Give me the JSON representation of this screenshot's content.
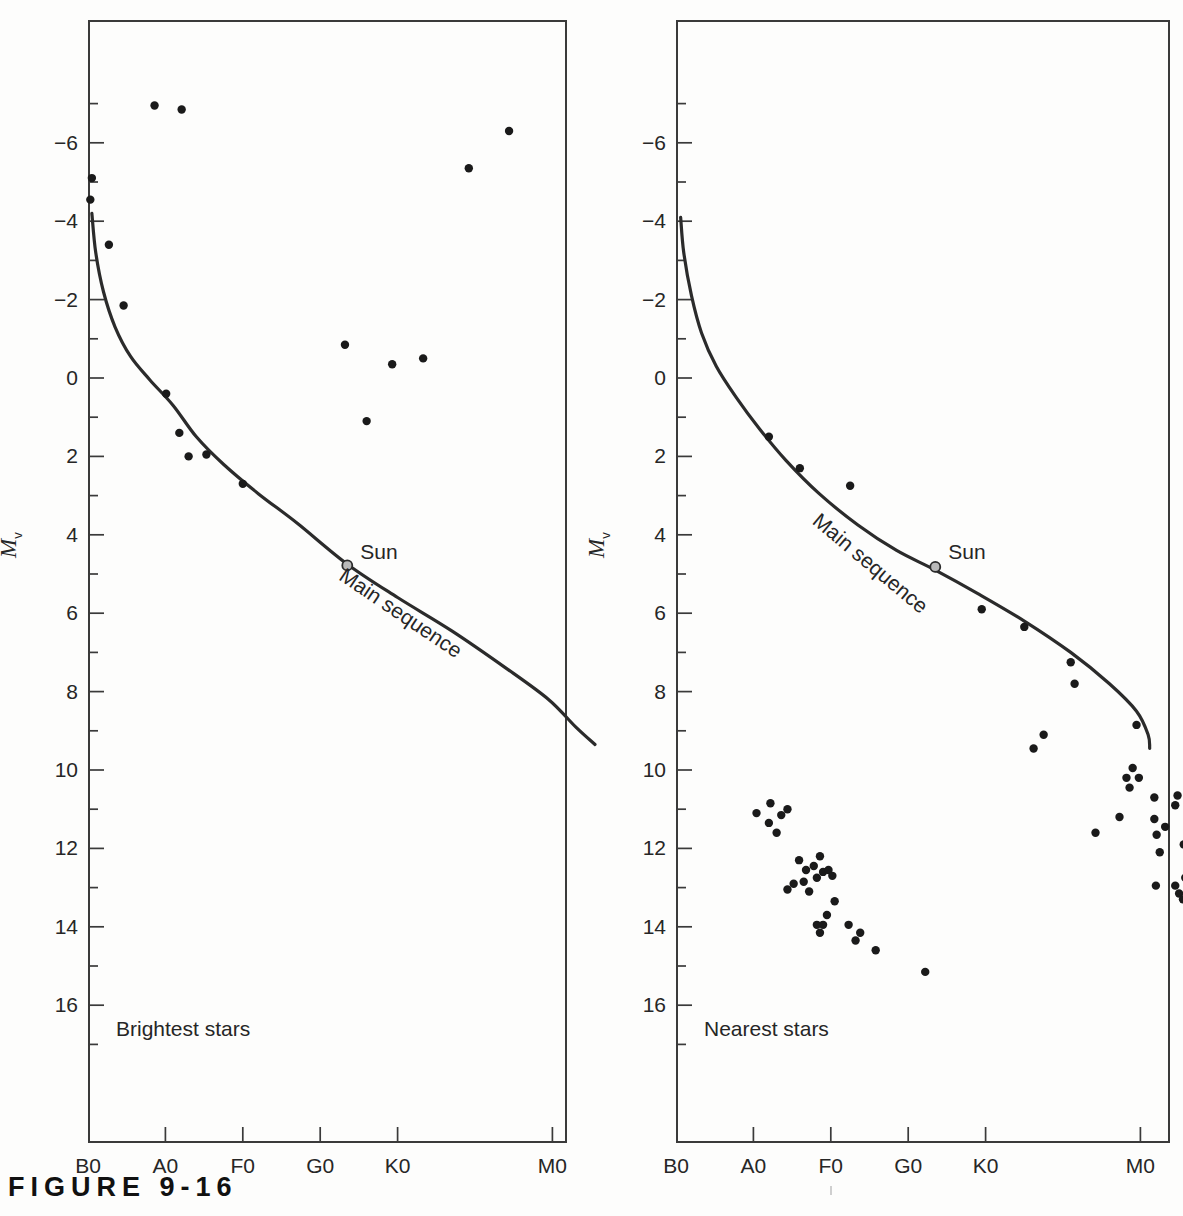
{
  "figure": {
    "caption": "F I G U R E   9 - 1 6",
    "caption_plain": "FIGURE 9-16"
  },
  "axis": {
    "y_title_symbol": "M",
    "y_title_subscript": "v",
    "y_ticks_major": [
      "-6",
      "-4",
      "-2",
      "0",
      "2",
      "4",
      "6",
      "8",
      "10",
      "12",
      "14",
      "16"
    ],
    "x_ticks": [
      "B0",
      "A0",
      "F0",
      "G0",
      "K0",
      "M0"
    ]
  },
  "panels": [
    {
      "id": "brightest",
      "caption": "Brightest stars",
      "sun_label": "Sun",
      "main_sequence_label": "Main sequence"
    },
    {
      "id": "nearest",
      "caption": "Nearest stars",
      "sun_label": "Sun",
      "main_sequence_label": "Main sequence"
    }
  ],
  "colors": {
    "ink": "#262626",
    "frame": "#3a3a3a",
    "point": "#1a1a1a",
    "curve": "#2b2b2b",
    "background": "#fdfdfc",
    "sun_marker_fill": "#b9b9b9"
  },
  "chart_data": [
    {
      "type": "scatter",
      "title": "Brightest stars",
      "xlabel": "Spectral type",
      "ylabel": "Mv",
      "xlim": [
        "B0",
        "M5"
      ],
      "ylim": [
        -7.6,
        17.4
      ],
      "y_inverted": true,
      "grid": false,
      "legend": "none",
      "x_categories": [
        "B0",
        "A0",
        "F0",
        "G0",
        "K0",
        "M0"
      ],
      "annotations": [
        {
          "text": "Sun",
          "x": 3.35,
          "y": 4.8
        },
        {
          "text": "Main sequence",
          "x": 3.9,
          "y": 6.4,
          "rotation": 34
        }
      ],
      "series": [
        {
          "name": "Brightest stars",
          "points": [
            {
              "x": 0.86,
              "y": -6.95
            },
            {
              "x": 1.21,
              "y": -6.85
            },
            {
              "x": 4.92,
              "y": -5.35
            },
            {
              "x": 5.44,
              "y": -6.3
            },
            {
              "x": 0.05,
              "y": -5.1
            },
            {
              "x": 0.03,
              "y": -4.55
            },
            {
              "x": 0.27,
              "y": -3.4
            },
            {
              "x": 0.46,
              "y": -1.85
            },
            {
              "x": 3.32,
              "y": -0.85
            },
            {
              "x": 3.93,
              "y": -0.35
            },
            {
              "x": 4.33,
              "y": -0.5
            },
            {
              "x": 3.6,
              "y": 1.1
            },
            {
              "x": 1.01,
              "y": 0.4
            },
            {
              "x": 1.18,
              "y": 1.4
            },
            {
              "x": 1.3,
              "y": 2.0
            },
            {
              "x": 1.53,
              "y": 1.95
            },
            {
              "x": 2.0,
              "y": 2.7
            }
          ]
        }
      ],
      "main_sequence_curve": [
        {
          "x": 0.05,
          "y": -4.2
        },
        {
          "x": 0.1,
          "y": -3.2
        },
        {
          "x": 0.2,
          "y": -2.2
        },
        {
          "x": 0.35,
          "y": -1.3
        },
        {
          "x": 0.55,
          "y": -0.55
        },
        {
          "x": 0.8,
          "y": 0.05
        },
        {
          "x": 1.1,
          "y": 0.7
        },
        {
          "x": 1.4,
          "y": 1.5
        },
        {
          "x": 1.75,
          "y": 2.2
        },
        {
          "x": 2.2,
          "y": 2.95
        },
        {
          "x": 2.7,
          "y": 3.7
        },
        {
          "x": 3.35,
          "y": 4.75
        },
        {
          "x": 4.0,
          "y": 5.6
        },
        {
          "x": 4.7,
          "y": 6.45
        },
        {
          "x": 5.4,
          "y": 7.4
        },
        {
          "x": 5.95,
          "y": 8.2
        },
        {
          "x": 6.3,
          "y": 8.9
        },
        {
          "x": 6.55,
          "y": 9.35
        }
      ],
      "sun_point": {
        "x": 3.35,
        "y": 4.78
      }
    },
    {
      "type": "scatter",
      "title": "Nearest stars",
      "xlabel": "Spectral type",
      "ylabel": "Mv",
      "xlim": [
        "B0",
        "M5"
      ],
      "ylim": [
        -7.6,
        17.4
      ],
      "y_inverted": true,
      "grid": false,
      "legend": "none",
      "x_categories": [
        "B0",
        "A0",
        "F0",
        "G0",
        "K0",
        "M0"
      ],
      "annotations": [
        {
          "text": "Sun",
          "x": 3.35,
          "y": 4.8
        },
        {
          "text": "Main sequence",
          "x": 2.35,
          "y": 5.1,
          "rotation": 40
        }
      ],
      "series": [
        {
          "name": "Main-sequence nearby stars",
          "points": [
            {
              "x": 1.2,
              "y": 1.5
            },
            {
              "x": 1.6,
              "y": 2.3
            },
            {
              "x": 2.25,
              "y": 2.75
            },
            {
              "x": 3.35,
              "y": 4.85
            },
            {
              "x": 3.95,
              "y": 5.9
            },
            {
              "x": 4.5,
              "y": 6.35
            },
            {
              "x": 5.1,
              "y": 7.25
            },
            {
              "x": 5.15,
              "y": 7.8
            },
            {
              "x": 4.75,
              "y": 9.1
            },
            {
              "x": 5.95,
              "y": 8.85
            }
          ]
        },
        {
          "name": "White dwarfs",
          "points": [
            {
              "x": 1.04,
              "y": 11.1
            },
            {
              "x": 1.22,
              "y": 10.85
            },
            {
              "x": 1.44,
              "y": 11.0
            },
            {
              "x": 1.36,
              "y": 11.15
            },
            {
              "x": 1.2,
              "y": 11.35
            },
            {
              "x": 1.3,
              "y": 11.6
            },
            {
              "x": 1.59,
              "y": 12.3
            },
            {
              "x": 1.86,
              "y": 12.2
            },
            {
              "x": 1.68,
              "y": 12.55
            },
            {
              "x": 1.78,
              "y": 12.45
            },
            {
              "x": 1.9,
              "y": 12.6
            },
            {
              "x": 1.97,
              "y": 12.55
            },
            {
              "x": 2.02,
              "y": 12.7
            },
            {
              "x": 1.82,
              "y": 12.75
            },
            {
              "x": 1.65,
              "y": 12.85
            },
            {
              "x": 1.52,
              "y": 12.9
            },
            {
              "x": 1.44,
              "y": 13.05
            },
            {
              "x": 1.72,
              "y": 13.1
            },
            {
              "x": 2.05,
              "y": 13.35
            },
            {
              "x": 1.95,
              "y": 13.7
            },
            {
              "x": 1.82,
              "y": 13.95
            },
            {
              "x": 1.9,
              "y": 13.95
            },
            {
              "x": 1.86,
              "y": 14.15
            },
            {
              "x": 2.23,
              "y": 13.95
            },
            {
              "x": 2.38,
              "y": 14.15
            },
            {
              "x": 2.32,
              "y": 14.35
            },
            {
              "x": 2.58,
              "y": 14.6
            },
            {
              "x": 3.22,
              "y": 15.15
            }
          ]
        },
        {
          "name": "Red dwarfs",
          "points": [
            {
              "x": 4.62,
              "y": 9.45
            },
            {
              "x": 5.9,
              "y": 9.95
            },
            {
              "x": 5.82,
              "y": 10.2
            },
            {
              "x": 5.98,
              "y": 10.2
            },
            {
              "x": 5.86,
              "y": 10.45
            },
            {
              "x": 6.18,
              "y": 10.7
            },
            {
              "x": 6.48,
              "y": 10.65
            },
            {
              "x": 6.45,
              "y": 10.9
            },
            {
              "x": 5.73,
              "y": 11.2
            },
            {
              "x": 6.18,
              "y": 11.25
            },
            {
              "x": 6.32,
              "y": 11.45
            },
            {
              "x": 5.42,
              "y": 11.6
            },
            {
              "x": 6.21,
              "y": 11.65
            },
            {
              "x": 6.65,
              "y": 11.65
            },
            {
              "x": 6.78,
              "y": 11.8
            },
            {
              "x": 6.56,
              "y": 11.9
            },
            {
              "x": 6.25,
              "y": 12.1
            },
            {
              "x": 6.72,
              "y": 12.2
            },
            {
              "x": 6.85,
              "y": 12.2
            },
            {
              "x": 6.68,
              "y": 12.55
            },
            {
              "x": 6.82,
              "y": 12.6
            },
            {
              "x": 6.58,
              "y": 12.75
            },
            {
              "x": 7.02,
              "y": 12.8
            },
            {
              "x": 6.2,
              "y": 12.95
            },
            {
              "x": 6.45,
              "y": 12.95
            },
            {
              "x": 6.65,
              "y": 12.95
            },
            {
              "x": 6.8,
              "y": 12.95
            },
            {
              "x": 6.98,
              "y": 12.95
            },
            {
              "x": 6.5,
              "y": 13.15
            },
            {
              "x": 7.05,
              "y": 13.15
            },
            {
              "x": 6.55,
              "y": 13.3
            },
            {
              "x": 7.02,
              "y": 13.55
            },
            {
              "x": 7.15,
              "y": 13.6
            },
            {
              "x": 6.92,
              "y": 13.95
            },
            {
              "x": 7.08,
              "y": 14.1
            },
            {
              "x": 7.22,
              "y": 14.1
            },
            {
              "x": 7.15,
              "y": 14.45
            },
            {
              "x": 7.18,
              "y": 15.7
            }
          ]
        }
      ],
      "main_sequence_curve": [
        {
          "x": 0.06,
          "y": -4.1
        },
        {
          "x": 0.1,
          "y": -3.2
        },
        {
          "x": 0.2,
          "y": -2.1
        },
        {
          "x": 0.33,
          "y": -1.15
        },
        {
          "x": 0.52,
          "y": -0.3
        },
        {
          "x": 0.78,
          "y": 0.5
        },
        {
          "x": 1.08,
          "y": 1.3
        },
        {
          "x": 1.42,
          "y": 2.1
        },
        {
          "x": 1.85,
          "y": 2.95
        },
        {
          "x": 2.35,
          "y": 3.75
        },
        {
          "x": 2.85,
          "y": 4.4
        },
        {
          "x": 3.35,
          "y": 4.9
        },
        {
          "x": 3.9,
          "y": 5.5
        },
        {
          "x": 4.5,
          "y": 6.2
        },
        {
          "x": 5.1,
          "y": 7.0
        },
        {
          "x": 5.6,
          "y": 7.8
        },
        {
          "x": 5.95,
          "y": 8.5
        },
        {
          "x": 6.1,
          "y": 9.1
        },
        {
          "x": 6.12,
          "y": 9.45
        }
      ],
      "sun_point": {
        "x": 3.35,
        "y": 4.82
      }
    }
  ]
}
